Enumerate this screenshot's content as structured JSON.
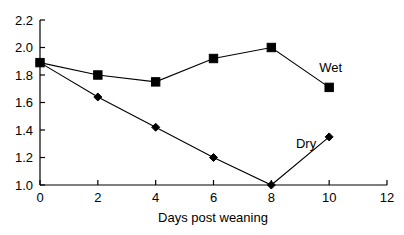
{
  "chart_data": {
    "type": "line",
    "title": "",
    "subtitle": "",
    "xlabel": "Days post weaning",
    "ylabel": "",
    "x": [
      0,
      2,
      4,
      6,
      8,
      10
    ],
    "xlim": [
      0,
      12
    ],
    "ylim": [
      1.0,
      2.2
    ],
    "xticks": [
      0,
      2,
      4,
      6,
      8,
      10,
      12
    ],
    "yticks": [
      1.0,
      1.2,
      1.4,
      1.6,
      1.8,
      2.0,
      2.2
    ],
    "xtick_labels": [
      "0",
      "2",
      "4",
      "6",
      "8",
      "10",
      "12"
    ],
    "ytick_labels": [
      "1.0",
      "1.2",
      "1.4",
      "1.6",
      "1.8",
      "2.0",
      "2.2"
    ],
    "grid": false,
    "legend_position": "inline-annotation",
    "line_color": "#000000",
    "background_color": "#ffffff",
    "series": [
      {
        "name": "Wet",
        "marker": "square",
        "values": [
          1.89,
          1.8,
          1.75,
          1.92,
          2.0,
          1.71
        ],
        "label_text": "Wet",
        "label_x": 10.05,
        "label_y": 1.855
      },
      {
        "name": "Dry",
        "marker": "diamond",
        "values": [
          1.89,
          1.64,
          1.42,
          1.2,
          1.0,
          1.35
        ],
        "label_text": "Dry",
        "label_x": 9.2,
        "label_y": 1.305
      }
    ]
  }
}
